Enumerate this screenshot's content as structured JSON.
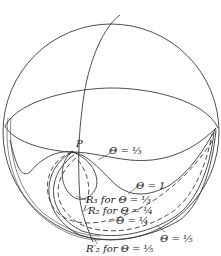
{
  "figure": {
    "type": "sphere-diagram"
  },
  "labels": {
    "point_p": "P",
    "theta_third": "Θ = ⅓",
    "theta_one": "Θ = 1",
    "r3_theta_third": "R₃ for Θ = ⅓",
    "r2_theta_quarter": "R₂ for Θ = ¼",
    "theta_quarter": "Θ = ¼",
    "theta_fifth": "Θ = ⅕",
    "r2prime_theta_fifth": "R′₂ for Θ = ⅕"
  },
  "colors": {
    "ink": "#3a3a3a",
    "text": "#222222",
    "background": "#ffffff"
  }
}
